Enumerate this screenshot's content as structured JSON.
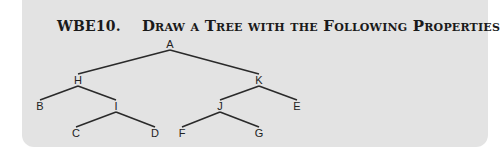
{
  "header": {
    "number": "WBE10.",
    "title": "Draw a Tree with the Following Properties"
  },
  "tree": {
    "nodes": [
      {
        "id": "A",
        "label": "A",
        "x": 170,
        "y": 48
      },
      {
        "id": "H",
        "label": "H",
        "x": 78,
        "y": 84
      },
      {
        "id": "K",
        "label": "K",
        "x": 259,
        "y": 84
      },
      {
        "id": "B",
        "label": "B",
        "x": 40,
        "y": 110
      },
      {
        "id": "I",
        "label": "I",
        "x": 116,
        "y": 110
      },
      {
        "id": "J",
        "label": "J",
        "x": 220,
        "y": 110
      },
      {
        "id": "E",
        "label": "E",
        "x": 297,
        "y": 110
      },
      {
        "id": "C",
        "label": "C",
        "x": 76,
        "y": 137
      },
      {
        "id": "D",
        "label": "D",
        "x": 155,
        "y": 137
      },
      {
        "id": "F",
        "label": "F",
        "x": 182,
        "y": 137
      },
      {
        "id": "G",
        "label": "G",
        "x": 259,
        "y": 137
      }
    ],
    "edges": [
      [
        "A",
        "H"
      ],
      [
        "A",
        "K"
      ],
      [
        "H",
        "B"
      ],
      [
        "H",
        "I"
      ],
      [
        "I",
        "C"
      ],
      [
        "I",
        "D"
      ],
      [
        "K",
        "J"
      ],
      [
        "K",
        "E"
      ],
      [
        "J",
        "F"
      ],
      [
        "J",
        "G"
      ]
    ]
  },
  "colors": {
    "panel_background": "#e3e3e3",
    "line": "#2a2a2a",
    "text": "#1a1a1a"
  }
}
